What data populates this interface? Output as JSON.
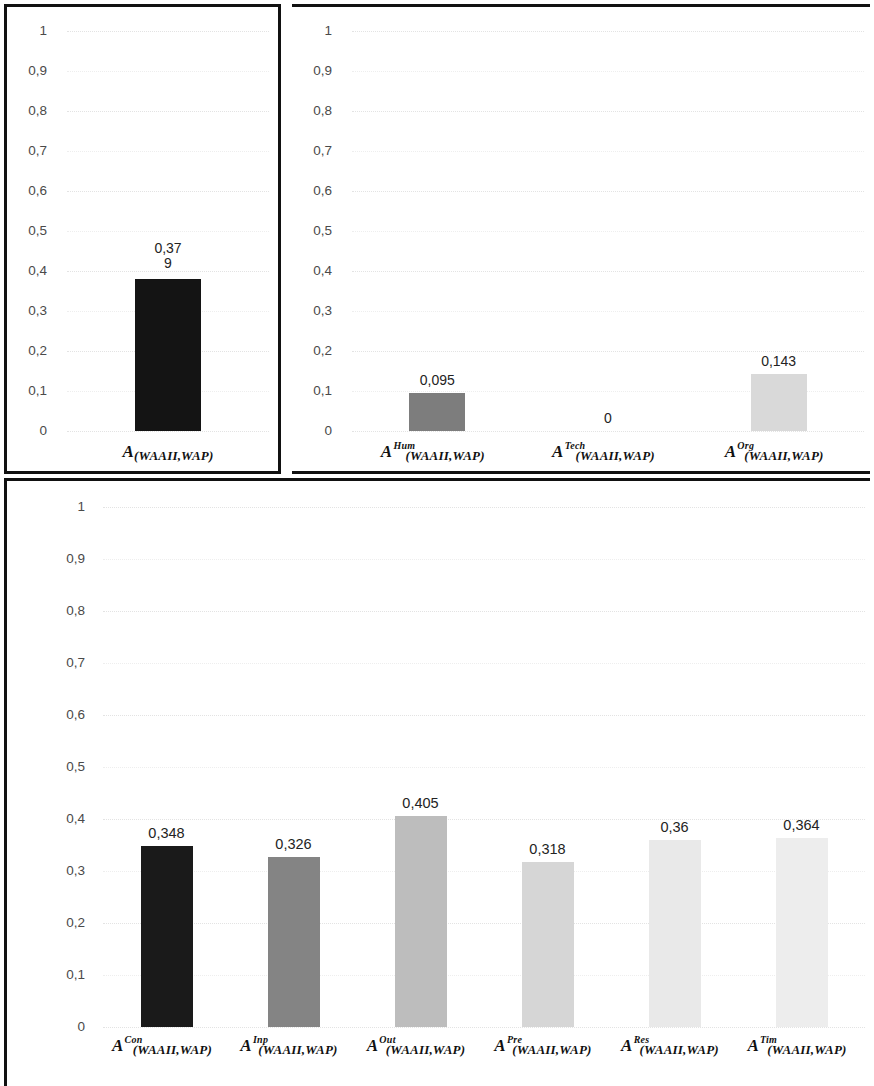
{
  "chart_data": [
    {
      "id": "overall",
      "type": "bar",
      "title": "",
      "xlabel": "",
      "ylabel": "",
      "ylim": [
        0,
        1
      ],
      "grid": true,
      "legend": "none",
      "yticks": [
        "1",
        "0,9",
        "0,8",
        "0,7",
        "0,6",
        "0,5",
        "0,4",
        "0,3",
        "0,2",
        "0,1",
        "0"
      ],
      "categories": [
        {
          "base": "A",
          "sup": "",
          "sub": "(WAAII,WAP)"
        }
      ],
      "values": [
        0.379
      ],
      "value_labels": [
        "0,37\n9"
      ],
      "bar_colors": [
        "#141414"
      ]
    },
    {
      "id": "dimensions",
      "type": "bar",
      "title": "",
      "xlabel": "",
      "ylabel": "",
      "ylim": [
        0,
        1
      ],
      "grid": true,
      "legend": "none",
      "yticks": [
        "1",
        "0,9",
        "0,8",
        "0,7",
        "0,6",
        "0,5",
        "0,4",
        "0,3",
        "0,2",
        "0,1",
        "0"
      ],
      "categories": [
        {
          "base": "A",
          "sup": "Hum",
          "sub": "(WAAII,WAP)"
        },
        {
          "base": "A",
          "sup": "Tech",
          "sub": "(WAAII,WAP)"
        },
        {
          "base": "A",
          "sup": "Org",
          "sub": "(WAAII,WAP)"
        }
      ],
      "values": [
        0.095,
        0,
        0.143
      ],
      "value_labels": [
        "0,095",
        "0",
        "0,143"
      ],
      "bar_colors": [
        "#7d7d7d",
        "#ffffff",
        "#d9d9d9"
      ]
    },
    {
      "id": "aspects",
      "type": "bar",
      "title": "",
      "xlabel": "",
      "ylabel": "",
      "ylim": [
        0,
        1
      ],
      "grid": true,
      "legend": "none",
      "yticks": [
        "1",
        "0,9",
        "0,8",
        "0,7",
        "0,6",
        "0,5",
        "0,4",
        "0,3",
        "0,2",
        "0,1",
        "0"
      ],
      "categories": [
        {
          "base": "A",
          "sup": "Con",
          "sub": "(WAAII,WAP)"
        },
        {
          "base": "A",
          "sup": "Inp",
          "sub": "(WAAII,WAP)"
        },
        {
          "base": "A",
          "sup": "Out",
          "sub": "(WAAII,WAP)"
        },
        {
          "base": "A",
          "sup": "Pre",
          "sub": "(WAAII,WAP)"
        },
        {
          "base": "A",
          "sup": "Res",
          "sub": "(WAAII,WAP)"
        },
        {
          "base": "A",
          "sup": "Tim",
          "sub": "(WAAII,WAP)"
        }
      ],
      "values": [
        0.348,
        0.326,
        0.405,
        0.318,
        0.36,
        0.364
      ],
      "value_labels": [
        "0,348",
        "0,326",
        "0,405",
        "0,318",
        "0,36",
        "0,364"
      ],
      "bar_colors": [
        "#1a1a1a",
        "#848484",
        "#bdbdbd",
        "#d6d6d6",
        "#e9e9e9",
        "#ededed"
      ]
    }
  ],
  "colors": {
    "panel_border": "#111111",
    "gridline": "#e3e3e3",
    "tick_text": "#4a4a4a",
    "label_text": "#232323"
  }
}
